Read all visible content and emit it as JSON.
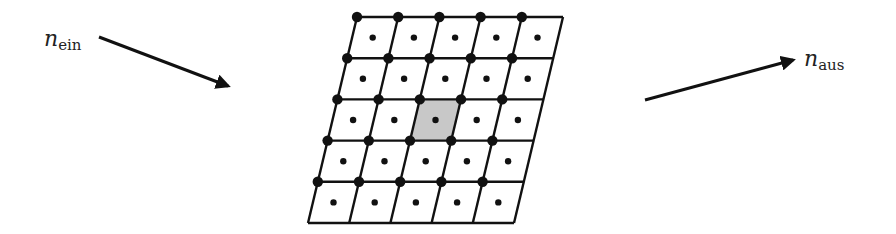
{
  "labels": {
    "incoming": {
      "symbol": "n",
      "subscript": "ein"
    },
    "outgoing": {
      "symbol": "n",
      "subscript": "aus"
    }
  },
  "lattice": {
    "rows": 5,
    "cols": 5,
    "highlighted_cell": {
      "row": 2,
      "col": 2
    },
    "highlight_color": "#c8c8c8",
    "line_color": "#111111",
    "node_color": "#111111"
  },
  "arrows": {
    "incoming": {
      "from": [
        99,
        37
      ],
      "to": [
        230,
        87
      ]
    },
    "outgoing": {
      "from": [
        645,
        100
      ],
      "to": [
        795,
        59
      ]
    }
  }
}
